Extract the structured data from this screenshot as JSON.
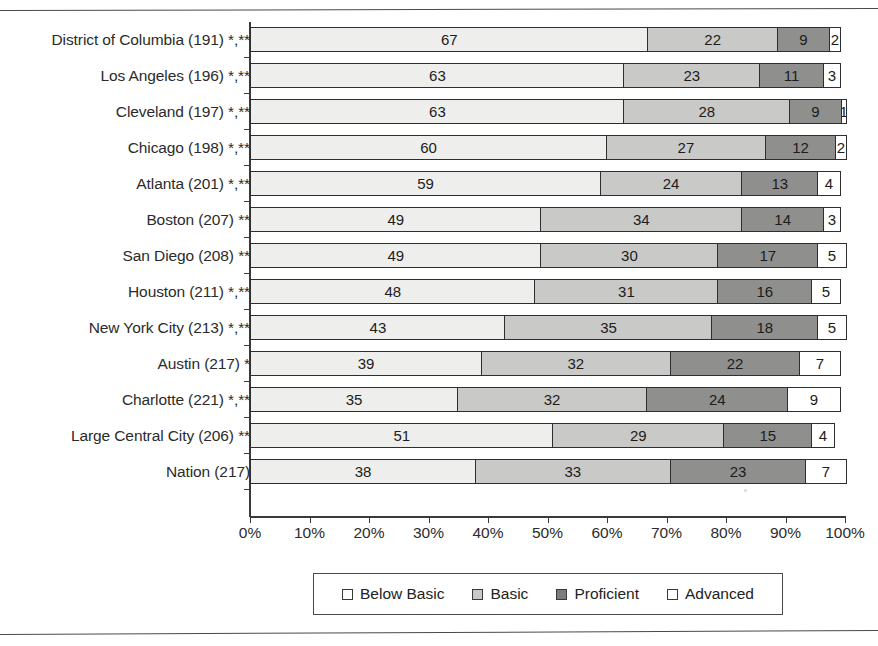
{
  "chart_data": {
    "type": "bar",
    "subtype": "stacked-horizontal-percentage",
    "title": "",
    "xlabel": "",
    "ylabel": "",
    "xlim": [
      0,
      100
    ],
    "xticks": [
      "0%",
      "10%",
      "20%",
      "30%",
      "40%",
      "50%",
      "60%",
      "70%",
      "80%",
      "90%",
      "100%"
    ],
    "xtick_values": [
      0,
      10,
      20,
      30,
      40,
      50,
      60,
      70,
      80,
      90,
      100
    ],
    "grid": false,
    "legend_position": "bottom",
    "legend": [
      "Below Basic",
      "Basic",
      "Proficient",
      "Advanced"
    ],
    "categories": [
      "District of Columbia (191) *,**",
      "Los Angeles (196) *,**",
      "Cleveland (197) *,**",
      "Chicago (198) *,**",
      "Atlanta (201) *,**",
      "Boston (207) **",
      "San Diego (208) **",
      "Houston (211) *,**",
      "New York City (213) *,**",
      "Austin (217) *",
      "Charlotte (221) *,**",
      "Large Central City (206) **",
      "Nation (217)"
    ],
    "series": [
      {
        "name": "Below Basic",
        "color": "#eeeeec",
        "values": [
          67,
          63,
          63,
          60,
          59,
          49,
          49,
          48,
          43,
          39,
          35,
          51,
          38
        ]
      },
      {
        "name": "Basic",
        "color": "#c9c9c7",
        "values": [
          22,
          23,
          28,
          27,
          24,
          34,
          30,
          31,
          35,
          32,
          32,
          29,
          33
        ]
      },
      {
        "name": "Proficient",
        "color": "#8f8f8d",
        "values": [
          9,
          11,
          9,
          12,
          13,
          14,
          17,
          16,
          18,
          22,
          24,
          15,
          23
        ]
      },
      {
        "name": "Advanced",
        "color": "#ffffff",
        "values": [
          2,
          3,
          1,
          2,
          4,
          3,
          5,
          5,
          5,
          7,
          9,
          4,
          7
        ]
      }
    ]
  },
  "legend": {
    "items": [
      {
        "label": "Below Basic",
        "swatch": "below"
      },
      {
        "label": "Basic",
        "swatch": "basic"
      },
      {
        "label": "Proficient",
        "swatch": "prof"
      },
      {
        "label": "Advanced",
        "swatch": "adv"
      }
    ]
  }
}
